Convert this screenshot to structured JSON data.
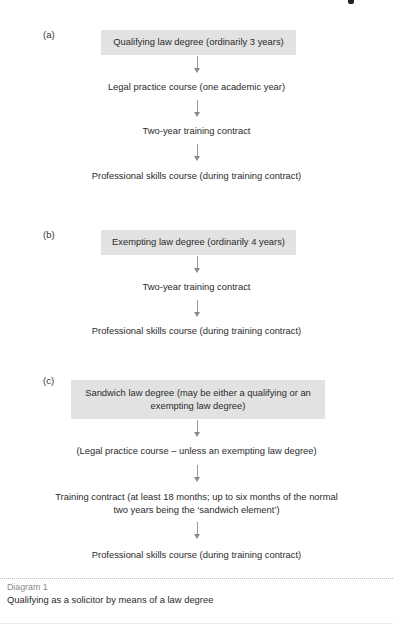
{
  "diagram": {
    "panels": [
      {
        "label": "(a)",
        "start_box": "Qualifying law degree (ordinarily 3 years)",
        "steps": [
          "Legal practice course (one academic year)",
          "Two-year training contract",
          "Professional skills course (during training contract)"
        ]
      },
      {
        "label": "(b)",
        "start_box": "Exempting law degree (ordinarily 4 years)",
        "steps": [
          "Two-year training contract",
          "Professional skills course (during training contract)"
        ]
      },
      {
        "label": "(c)",
        "start_box_line1": "Sandwich law degree (may be either a qualifying or an",
        "start_box_line2": "exempting law degree)",
        "steps": [
          "(Legal practice course – unless an exempting law degree)",
          "Training contract (at least 18 months; up to six months of the normal",
          "two years being the ‘sandwich element’)",
          "Professional skills course (during training contract)"
        ]
      }
    ],
    "arrow_icon": "down-arrow-icon",
    "colors": {
      "box_fill": "#e2e2e2",
      "arrow": "#9a9a9a",
      "caption_label": "#8a8a8a",
      "text": "#2b2b2b"
    }
  },
  "caption": {
    "label": "Diagram 1",
    "text": "Qualifying as a solicitor by means of a law degree"
  }
}
